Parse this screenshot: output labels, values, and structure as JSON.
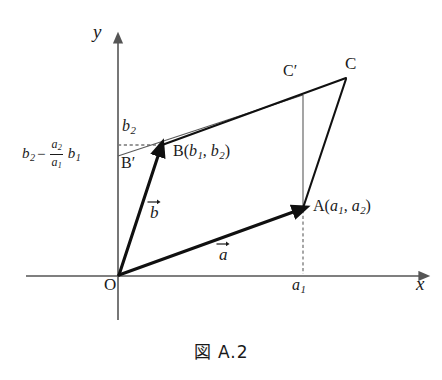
{
  "figure": {
    "caption": "図 A.2",
    "axes": {
      "y_label": "y",
      "x_label": "x",
      "origin_label": "O"
    },
    "ticks": {
      "x_tick_a1": "a",
      "x_tick_a1_sub": "1",
      "y_tick_b2": "b",
      "y_tick_b2_sub": "2"
    },
    "expression": {
      "lead_var": "b",
      "lead_sub": "2",
      "minus": "−",
      "frac_num_var": "a",
      "frac_num_sub": "2",
      "frac_den_var": "a",
      "frac_den_sub": "1",
      "trail_var": "b",
      "trail_sub": "1",
      "full_text": "b2 − (a2/a1) b1"
    },
    "points": {
      "origin": "O",
      "a": "A(a1, a2)",
      "a_name": "A",
      "a_open": "(",
      "a_c1": "a",
      "a_c1_sub": "1",
      "a_comma": ", ",
      "a_c2": "a",
      "a_c2_sub": "2",
      "a_close": ")",
      "b": "B(b1, b2)",
      "b_name": "B",
      "b_open": "(",
      "b_c1": "b",
      "b_c1_sub": "1",
      "b_comma": ", ",
      "b_c2": "b",
      "b_c2_sub": "2",
      "b_close": ")",
      "b_prime": "B′",
      "c": "C",
      "c_prime": "C′"
    },
    "vectors": {
      "a_label": "a",
      "b_label": "b"
    },
    "colors": {
      "stroke_dark": "#1a1a1a",
      "axis_gray": "#555555",
      "thin_gray": "#5a5a5a",
      "dashed_gray": "#7a7a7a",
      "background": "#ffffff"
    },
    "geometry": {
      "origin_xy": [
        118,
        276
      ],
      "point_a_xy": [
        303,
        207
      ],
      "point_b_xy": [
        162,
        145
      ],
      "point_bprime_xy": [
        118,
        155
      ],
      "point_c_xy": [
        345,
        78
      ],
      "point_cprime_xy": [
        303,
        95
      ],
      "x_axis_span": [
        26,
        428
      ],
      "y_axis_span": [
        36,
        320
      ]
    }
  }
}
